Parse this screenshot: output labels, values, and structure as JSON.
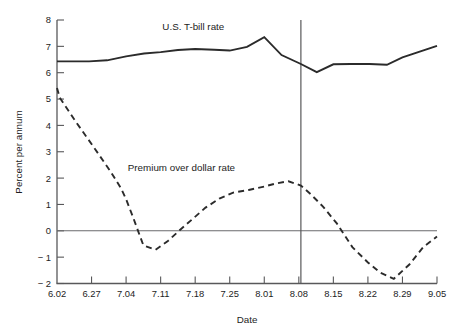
{
  "chart_data": {
    "type": "line",
    "title": "",
    "xlabel": "Date",
    "ylabel": "Percent per annum",
    "categories": [
      "6.02",
      "6.27",
      "7.04",
      "7.11",
      "7.18",
      "7.25",
      "8.01",
      "8.08",
      "8.15",
      "8.22",
      "8.29",
      "9.05"
    ],
    "xlim": [
      0,
      11
    ],
    "ylim": [
      -2,
      8
    ],
    "yticks": [
      8,
      7,
      6,
      5,
      4,
      3,
      2,
      1,
      0,
      -1,
      -2
    ],
    "yticklabels": [
      "8",
      "7",
      "6",
      "5",
      "4",
      "3",
      "2",
      "1",
      "0",
      "− 1",
      "− 2"
    ],
    "grid": false,
    "legend_position": "inline-annotations",
    "annotations": [
      {
        "text": "U.S. T-bill rate",
        "x": 3.05,
        "y": 7.62
      },
      {
        "text": "Premium over dollar rate",
        "x": 2.05,
        "y": 2.28
      }
    ],
    "reference_lines": [
      {
        "orientation": "horizontal",
        "value": 0,
        "name": "zero-line"
      },
      {
        "orientation": "vertical",
        "value": 7.06,
        "name": "event-marker-line"
      }
    ],
    "series": [
      {
        "name": "U.S. T-bill rate",
        "style": "solid",
        "color": "#2b2b2b",
        "x": [
          0,
          0.4,
          0.93,
          1.45,
          2.0,
          2.52,
          3.0,
          3.5,
          4.0,
          4.55,
          5.0,
          5.5,
          6.0,
          6.5,
          7.06,
          7.52,
          8.0,
          8.5,
          9.05,
          9.55,
          10.0,
          11.0
        ],
        "values": [
          6.43,
          6.43,
          6.43,
          6.47,
          6.62,
          6.73,
          6.78,
          6.86,
          6.9,
          6.87,
          6.84,
          6.98,
          7.35,
          6.67,
          6.33,
          6.02,
          6.32,
          6.33,
          6.33,
          6.3,
          6.58,
          7.02
        ]
      },
      {
        "name": "Premium over dollar rate",
        "style": "dashed",
        "color": "#2b2b2b",
        "x": [
          0,
          0.08,
          0.55,
          1.05,
          1.55,
          1.85,
          2.0,
          2.2,
          2.5,
          2.85,
          3.2,
          3.55,
          3.9,
          4.3,
          4.7,
          5.1,
          5.55,
          6.0,
          6.35,
          6.7,
          7.06,
          7.35,
          7.7,
          8.1,
          8.55,
          9.0,
          9.35,
          9.75,
          10.2,
          10.6,
          11.0
        ],
        "values": [
          5.42,
          5.05,
          4.13,
          3.2,
          2.25,
          1.62,
          1.2,
          0.52,
          -0.55,
          -0.72,
          -0.4,
          0.02,
          0.42,
          0.88,
          1.22,
          1.45,
          1.55,
          1.68,
          1.8,
          1.88,
          1.72,
          1.38,
          0.92,
          0.28,
          -0.62,
          -1.2,
          -1.58,
          -1.82,
          -1.28,
          -0.62,
          -0.22
        ]
      }
    ]
  },
  "axes": {
    "ylabel_text": "Percent per annum",
    "xlabel_text": "Date"
  }
}
